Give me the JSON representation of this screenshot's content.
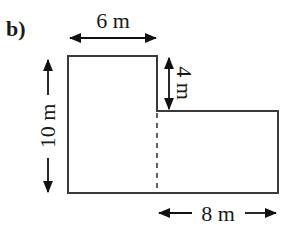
{
  "figure": {
    "part_label": "b)",
    "shape": "L-shaped composite rectangle",
    "colors": {
      "stroke": "#3a3a3a",
      "arrow": "#111111",
      "text": "#1a1a1a",
      "background": "#ffffff"
    }
  },
  "dimensions": {
    "top_width": {
      "label": "6 m",
      "value": 6,
      "unit": "m"
    },
    "left_height": {
      "label": "10 m",
      "value": 10,
      "unit": "m"
    },
    "step_height": {
      "label": "4 m",
      "value": 4,
      "unit": "m"
    },
    "bottom_width": {
      "label": "8 m",
      "value": 8,
      "unit": "m"
    }
  },
  "divider": {
    "style": "dashed",
    "description": "vertical dashed line splitting shape into two rectangles"
  }
}
